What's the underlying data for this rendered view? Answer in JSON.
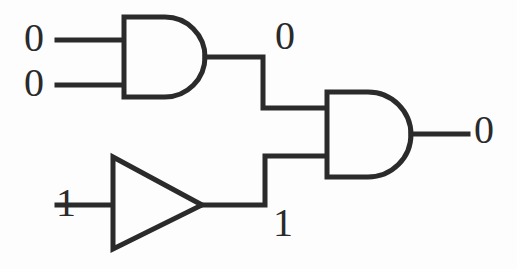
{
  "diagram": {
    "type": "logic-circuit-schematic",
    "stroke_color": "#2b2b2b",
    "background_color": "#fdfdfd",
    "width": 517,
    "height": 269
  },
  "labels": {
    "input_a": "0",
    "input_b": "0",
    "input_c": "1",
    "and1_output": "0",
    "buffer_output": "1",
    "final_output": "0"
  },
  "gates": [
    {
      "id": "and-gate-1",
      "kind": "AND",
      "inputs": [
        "0",
        "0"
      ],
      "output": "0"
    },
    {
      "id": "buffer-gate-1",
      "kind": "BUFFER",
      "inputs": [
        "1"
      ],
      "output": "1"
    },
    {
      "id": "and-gate-2",
      "kind": "AND",
      "inputs": [
        "0",
        "1"
      ],
      "output": "0"
    }
  ],
  "wires": [
    {
      "id": "wire-input-a",
      "from": "input_a",
      "to": "and-gate-1"
    },
    {
      "id": "wire-input-b",
      "from": "input_b",
      "to": "and-gate-1"
    },
    {
      "id": "wire-input-c",
      "from": "input_c",
      "to": "buffer-gate-1"
    },
    {
      "id": "wire-and1-to-and2",
      "from": "and-gate-1",
      "to": "and-gate-2"
    },
    {
      "id": "wire-buffer-to-and2",
      "from": "buffer-gate-1",
      "to": "and-gate-2"
    },
    {
      "id": "wire-final-output",
      "from": "and-gate-2",
      "to": "final_output"
    }
  ]
}
